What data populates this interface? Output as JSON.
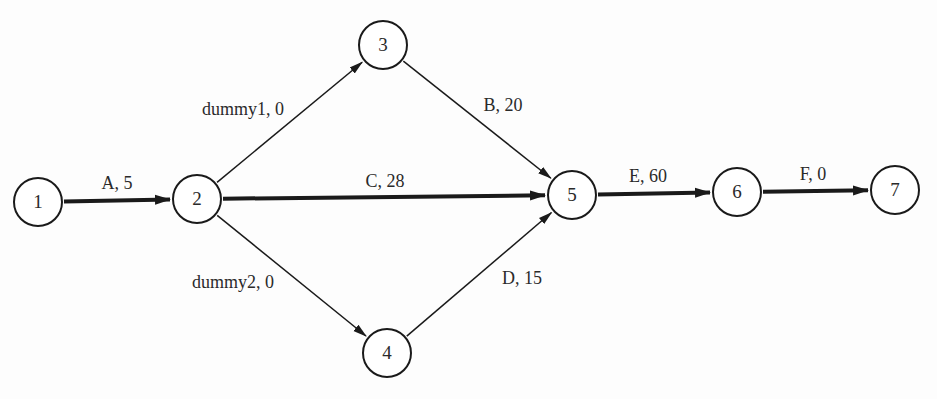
{
  "diagram": {
    "type": "activity-on-arrow network",
    "nodes": [
      {
        "id": "1",
        "label": "1",
        "x": 38,
        "y": 202
      },
      {
        "id": "2",
        "label": "2",
        "x": 197,
        "y": 199
      },
      {
        "id": "3",
        "label": "3",
        "x": 383,
        "y": 45
      },
      {
        "id": "4",
        "label": "4",
        "x": 387,
        "y": 353
      },
      {
        "id": "5",
        "label": "5",
        "x": 572,
        "y": 195
      },
      {
        "id": "6",
        "label": "6",
        "x": 737,
        "y": 192
      },
      {
        "id": "7",
        "label": "7",
        "x": 895,
        "y": 190
      }
    ],
    "edges": [
      {
        "from": "1",
        "to": "2",
        "label": "A, 5",
        "activity": "A",
        "duration": 5,
        "critical": true,
        "lx": 117,
        "ly": 183
      },
      {
        "from": "2",
        "to": "3",
        "label": "dummy1, 0",
        "activity": "dummy1",
        "duration": 0,
        "critical": false,
        "lx": 243,
        "ly": 109
      },
      {
        "from": "2",
        "to": "5",
        "label": "C, 28",
        "activity": "C",
        "duration": 28,
        "critical": true,
        "lx": 385,
        "ly": 181
      },
      {
        "from": "2",
        "to": "4",
        "label": "dummy2, 0",
        "activity": "dummy2",
        "duration": 0,
        "critical": false,
        "lx": 233,
        "ly": 282
      },
      {
        "from": "3",
        "to": "5",
        "label": "B, 20",
        "activity": "B",
        "duration": 20,
        "critical": false,
        "lx": 503,
        "ly": 105
      },
      {
        "from": "4",
        "to": "5",
        "label": "D, 15",
        "activity": "D",
        "duration": 15,
        "critical": false,
        "lx": 522,
        "ly": 278
      },
      {
        "from": "5",
        "to": "6",
        "label": "E, 60",
        "activity": "E",
        "duration": 60,
        "critical": true,
        "lx": 648,
        "ly": 176
      },
      {
        "from": "6",
        "to": "7",
        "label": "F, 0",
        "activity": "F",
        "duration": 0,
        "critical": true,
        "lx": 813,
        "ly": 174
      }
    ]
  },
  "colors": {
    "line": "#1a1a1a",
    "text": "#2a2a2a",
    "background": "#fdfdfd"
  }
}
